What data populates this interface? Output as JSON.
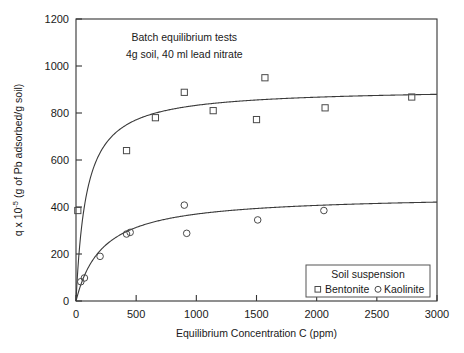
{
  "chart_data": {
    "type": "scatter",
    "title": "",
    "xlabel": "Equilibrium Concentration  C (ppm)",
    "ylabel": "q x 10-5 (g of Pb adsorbed/g soil)",
    "ylabel_parts": {
      "prefix": "q x 10",
      "exponent": "-5",
      "suffix": " (g of Pb adsorbed/g soil)"
    },
    "xlim": [
      0,
      3000
    ],
    "ylim": [
      0,
      1200
    ],
    "xticks": [
      0,
      500,
      1000,
      1500,
      2000,
      2500,
      3000
    ],
    "yticks": [
      0,
      200,
      400,
      600,
      800,
      1000,
      1200
    ],
    "xticklabels": [
      "0",
      "500",
      "1000",
      "1500",
      "2000",
      "2500",
      "3000"
    ],
    "yticklabels": [
      "0",
      "200",
      "400",
      "600",
      "800",
      "1000",
      "1200"
    ],
    "grid": false,
    "legend_position": "lower-right",
    "annotations": [
      {
        "text": "Batch equilibrium tests",
        "x": 900,
        "y": 1105
      },
      {
        "text": "4g soil, 40 ml lead nitrate",
        "x": 900,
        "y": 1035
      }
    ],
    "series": [
      {
        "name": "Bentonite",
        "marker": "square",
        "points": [
          {
            "x": 15,
            "y": 385
          },
          {
            "x": 420,
            "y": 640
          },
          {
            "x": 660,
            "y": 780
          },
          {
            "x": 900,
            "y": 888
          },
          {
            "x": 1140,
            "y": 810
          },
          {
            "x": 1500,
            "y": 772
          },
          {
            "x": 1570,
            "y": 950
          },
          {
            "x": 2070,
            "y": 822
          },
          {
            "x": 2790,
            "y": 868
          }
        ],
        "fit": {
          "model": "langmuir",
          "qmax": 905,
          "b": 0.0115,
          "comment": "q = qmax*b*C/(1+b*C)"
        }
      },
      {
        "name": "Kaolinite",
        "marker": "circle",
        "points": [
          {
            "x": 40,
            "y": 82
          },
          {
            "x": 70,
            "y": 98
          },
          {
            "x": 200,
            "y": 190
          },
          {
            "x": 420,
            "y": 285
          },
          {
            "x": 450,
            "y": 292
          },
          {
            "x": 900,
            "y": 408
          },
          {
            "x": 920,
            "y": 288
          },
          {
            "x": 1510,
            "y": 345
          },
          {
            "x": 2060,
            "y": 385
          }
        ],
        "fit": {
          "model": "langmuir",
          "qmax": 452,
          "b": 0.0045,
          "comment": "q = qmax*b*C/(1+b*C)"
        }
      }
    ],
    "legend": {
      "title": "Soil suspension",
      "entries": [
        {
          "label": "Bentonite",
          "marker": "square"
        },
        {
          "label": "Kaolinite",
          "marker": "circle"
        }
      ]
    }
  }
}
